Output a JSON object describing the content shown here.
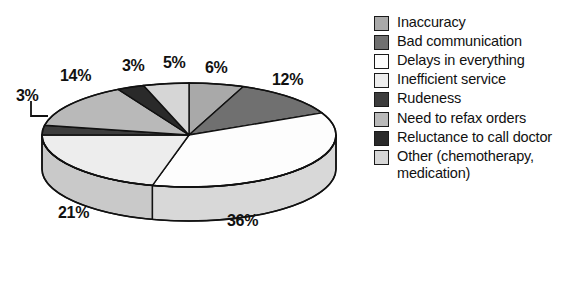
{
  "chart_data": {
    "type": "pie",
    "title": "",
    "subtitle": "",
    "xlabel": "",
    "ylabel": "",
    "grid": false,
    "legend_position": "right",
    "three_d": true,
    "start_angle_deg": 0,
    "direction": "clockwise",
    "categories": [
      "Inaccuracy",
      "Bad communication",
      "Delays in everything",
      "Inefficient service",
      "Rudeness",
      "Need to refax orders",
      "Reluctance to call doctor",
      "Other (chemotherapy, medication)"
    ],
    "values": [
      6,
      12,
      36,
      21,
      3,
      14,
      3,
      5
    ],
    "value_labels": [
      "6%",
      "12%",
      "36%",
      "21%",
      "3%",
      "14%",
      "3%",
      "5%"
    ],
    "colors": [
      "#a9a9a9",
      "#707070",
      "#fdfdfd",
      "#ededed",
      "#3d3d3d",
      "#b9b9b9",
      "#2a2a2a",
      "#d6d6d6"
    ],
    "side_colors": [
      "#8e8e8e",
      "#5c5c5c",
      "#d8d8d8",
      "#c9c9c9",
      "#303030",
      "#9d9d9d",
      "#202020",
      "#b6b6b6"
    ],
    "outline_color": "#111111"
  },
  "legend": {
    "items": [
      {
        "label": "Inaccuracy",
        "color": "#a9a9a9",
        "value": "6%"
      },
      {
        "label": "Bad communication",
        "color": "#707070",
        "value": "12%"
      },
      {
        "label": "Delays in everything",
        "color": "#fdfdfd",
        "value": "36%"
      },
      {
        "label": "Inefficient service",
        "color": "#ededed",
        "value": "21%"
      },
      {
        "label": "Rudeness",
        "color": "#3d3d3d",
        "value": "3%"
      },
      {
        "label": "Need to refax orders",
        "color": "#b9b9b9",
        "value": "14%"
      },
      {
        "label": "Reluctance to call doctor",
        "color": "#2a2a2a",
        "value": "3%"
      },
      {
        "label": "Other (chemotherapy, medication)",
        "color": "#d6d6d6",
        "value": "5%"
      }
    ]
  },
  "pie_labels": [
    {
      "text": "6%",
      "x": 205,
      "y": 60
    },
    {
      "text": "12%",
      "x": 272,
      "y": 72
    },
    {
      "text": "36%",
      "x": 227,
      "y": 213
    },
    {
      "text": "21%",
      "x": 58,
      "y": 205
    },
    {
      "text": "3%",
      "x": 16,
      "y": 88
    },
    {
      "text": "14%",
      "x": 60,
      "y": 68
    },
    {
      "text": "3%",
      "x": 122,
      "y": 58
    },
    {
      "text": "5%",
      "x": 163,
      "y": 55
    }
  ]
}
